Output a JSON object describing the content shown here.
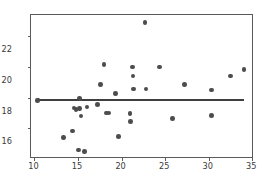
{
  "chart_data": {
    "type": "scatter",
    "title": "",
    "xlabel": "",
    "ylabel": "",
    "xlim": [
      9.6,
      35.2
    ],
    "ylim": [
      14.0,
      23.4
    ],
    "xticks": [
      10,
      15,
      20,
      25,
      30,
      35
    ],
    "yticks": [
      16,
      18,
      20,
      22
    ],
    "xtick_labels": [
      "10",
      "15",
      "20",
      "25",
      "30",
      "35"
    ],
    "ytick_labels": [
      "16",
      "18",
      "20",
      "22"
    ],
    "grid": false,
    "legend": null,
    "marker_color": "#4d4d4d",
    "line_color": "#3f3f3f",
    "frame_color": "#5a5a5a",
    "background": "#ffffff",
    "series": [
      {
        "name": "observations",
        "marker": "circle",
        "points": [
          [
            10.35,
            17.82
          ],
          [
            10.42,
            17.86
          ],
          [
            13.3,
            15.4
          ],
          [
            14.35,
            15.82
          ],
          [
            14.55,
            17.32
          ],
          [
            14.75,
            17.22
          ],
          [
            15.05,
            14.6
          ],
          [
            15.15,
            17.95
          ],
          [
            15.2,
            17.3
          ],
          [
            15.35,
            16.82
          ],
          [
            15.75,
            14.5
          ],
          [
            16.05,
            17.4
          ],
          [
            17.2,
            17.55
          ],
          [
            17.55,
            18.88
          ],
          [
            18.0,
            20.18
          ],
          [
            18.3,
            17.0
          ],
          [
            18.55,
            17.0
          ],
          [
            19.3,
            18.28
          ],
          [
            19.65,
            15.48
          ],
          [
            20.95,
            16.98
          ],
          [
            21.05,
            16.45
          ],
          [
            21.25,
            20.0
          ],
          [
            21.3,
            19.42
          ],
          [
            21.35,
            18.58
          ],
          [
            22.7,
            22.9
          ],
          [
            22.8,
            18.58
          ],
          [
            24.35,
            20.0
          ],
          [
            25.85,
            16.65
          ],
          [
            27.2,
            18.88
          ],
          [
            30.3,
            18.5
          ],
          [
            30.35,
            16.85
          ],
          [
            32.5,
            19.42
          ],
          [
            34.05,
            19.85
          ]
        ]
      }
    ],
    "fit_line": {
      "name": "regression-line",
      "x_start": 10.3,
      "x_end": 34.1,
      "y_start": 17.85,
      "y_end": 17.84,
      "slope": 0.0,
      "intercept": 17.85
    }
  }
}
